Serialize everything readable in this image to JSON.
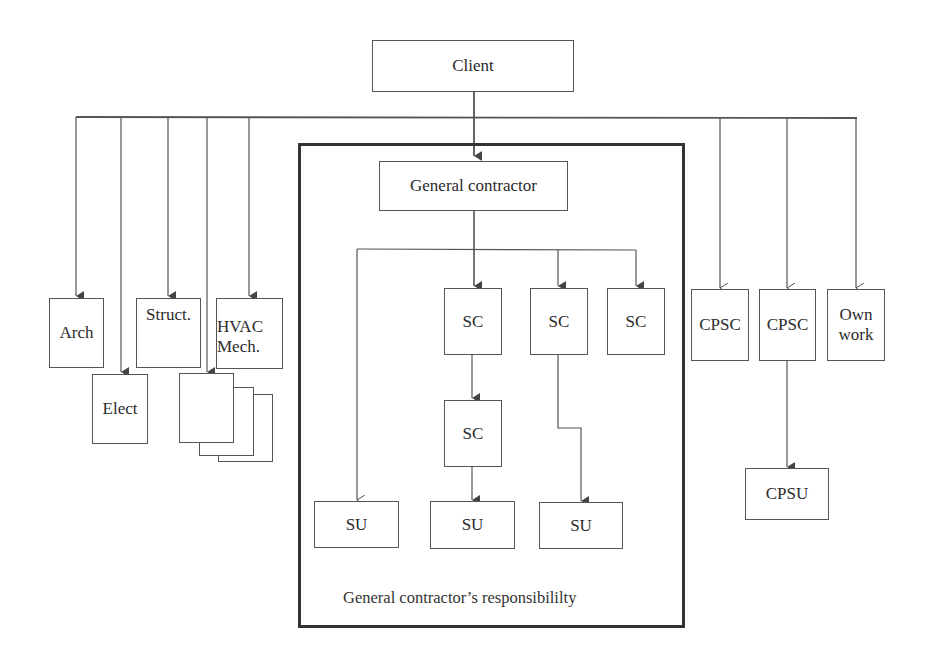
{
  "diagram": {
    "client": "Client",
    "general_contractor": "General contractor",
    "responsibility_caption": "General contractor’s responsibililty",
    "left_consultants": {
      "arch": "Arch",
      "elect": "Elect",
      "struct": "Struct.",
      "hvac_line1": "HVAC",
      "hvac_line2": "Mech.",
      "stack": ""
    },
    "subcontractors": {
      "sc1": "SC",
      "sc2": "SC",
      "sc3": "SC",
      "sc4": "SC"
    },
    "suppliers": {
      "su1": "SU",
      "su2": "SU",
      "su3": "SU"
    },
    "right_units": {
      "cpsc1": "CPSC",
      "cpsc2": "CPSC",
      "own_line1": "Own",
      "own_line2": "work",
      "cpsu": "CPSU"
    },
    "colors": {
      "line": "#555555",
      "frame": "#333333",
      "text": "#2b2b2b"
    }
  }
}
